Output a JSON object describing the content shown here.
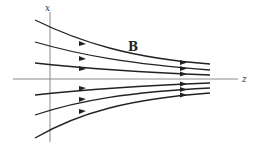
{
  "diagram": {
    "labels": {
      "x_axis": "x",
      "z_axis": "z",
      "field": "B"
    },
    "colors": {
      "line": "#222222",
      "axis": "#8a8a8a",
      "background": "#ffffff"
    },
    "field_lines_count": 6
  }
}
